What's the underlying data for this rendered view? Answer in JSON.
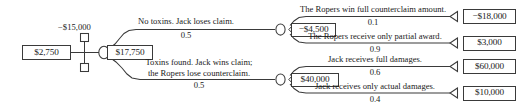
{
  "diagram": {
    "type": "decision-tree",
    "nodes": {
      "root_value": "$2,750",
      "decision_cost": "−$15,000",
      "chance_value": "$17,750",
      "counterclaim_value": "−$4,500",
      "damages_value": "$40,000"
    },
    "branches": {
      "no_toxins": {
        "label": "No toxins.  Jack loses claim.",
        "probability": "0.5"
      },
      "toxins_found": {
        "label_line1": "Toxins found. Jack wins claim;",
        "label_line2": "the Ropers lose counterclaim.",
        "probability": "0.5"
      },
      "ropers_win_full": {
        "label": "The Ropers win full counterclaim amount.",
        "probability": "0.1",
        "payoff": "−$18,000"
      },
      "ropers_partial": {
        "label": "The Ropers receive only partial award.",
        "probability": "0.9",
        "payoff": "$3,000"
      },
      "jack_full_damages": {
        "label": "Jack receives full damages.",
        "probability": "0.6",
        "payoff": "$60,000"
      },
      "jack_actual_damages": {
        "label": "Jack receives only actual damages.",
        "probability": "0.4",
        "payoff": "$10,000"
      }
    },
    "colors": {
      "stroke": "#3a3a3a",
      "text": "#1a1a1a",
      "background": "#ffffff"
    }
  }
}
